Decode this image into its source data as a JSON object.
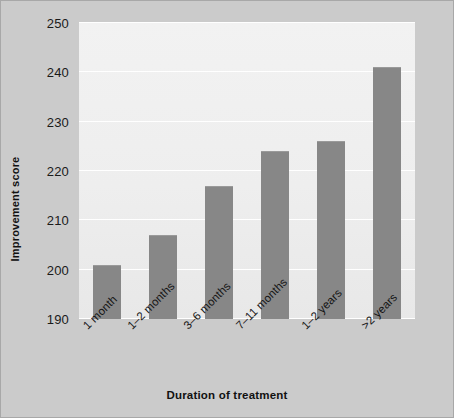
{
  "chart_data": {
    "type": "bar",
    "title": "",
    "subtitle": "",
    "xlabel": "Duration of treatment",
    "ylabel": "Improvement score",
    "categories": [
      "1 month",
      "1–2 months",
      "3–6 months",
      "7–11 months",
      "1–2 years",
      ">2 years"
    ],
    "values": [
      201,
      207,
      217,
      224,
      226,
      241
    ],
    "ylim": [
      190,
      250
    ],
    "yticks": [
      190,
      200,
      210,
      220,
      230,
      240,
      250
    ],
    "ytick_labels": [
      "190",
      "200",
      "210",
      "220",
      "230",
      "240",
      "250"
    ],
    "grid": true,
    "grid_axis": "y",
    "legend": false,
    "legend_position": "none",
    "bar_color": "#878787",
    "plot_background": "#efefef",
    "figure_background": "#cbcbcb",
    "gridline_color": "#ffffff",
    "xtick_rotation": -45
  },
  "axes": {
    "y_title": "Improvement score",
    "x_title": "Duration of treatment"
  }
}
